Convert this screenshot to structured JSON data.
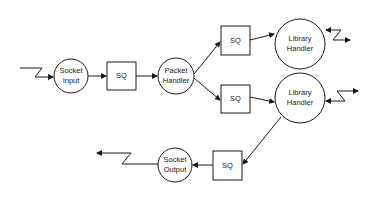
{
  "diagram": {
    "title": "",
    "stroke_color": "#1a1a1a",
    "background": "#ffffff",
    "nodes": [
      {
        "id": "socket-input",
        "shape": "circle",
        "label_line1": "Socket",
        "label_line2": "Input"
      },
      {
        "id": "sq-1",
        "shape": "square",
        "label": "SQ"
      },
      {
        "id": "packet-handler",
        "shape": "circle",
        "label_line1": "Packet",
        "label_line2": "Handler"
      },
      {
        "id": "sq-2",
        "shape": "square",
        "label": "SQ"
      },
      {
        "id": "sq-3",
        "shape": "square",
        "label": "SQ"
      },
      {
        "id": "library-handler-1",
        "shape": "circle",
        "label_line1": "Library",
        "label_line2": "Handler"
      },
      {
        "id": "library-handler-2",
        "shape": "circle",
        "label_line1": "Library",
        "label_line2": "Handler"
      },
      {
        "id": "sq-4",
        "shape": "square",
        "label": "SQ"
      },
      {
        "id": "socket-output",
        "shape": "circle",
        "label_line1": "Socket",
        "label_line2": "Output"
      }
    ],
    "edges": [
      {
        "from": "external-in",
        "to": "socket-input",
        "style": "lightning"
      },
      {
        "from": "socket-input",
        "to": "sq-1",
        "style": "arrow"
      },
      {
        "from": "sq-1",
        "to": "packet-handler",
        "style": "arrow"
      },
      {
        "from": "packet-handler",
        "to": "sq-2",
        "style": "arrow"
      },
      {
        "from": "packet-handler",
        "to": "sq-3",
        "style": "arrow"
      },
      {
        "from": "sq-2",
        "to": "library-handler-1",
        "style": "arrow"
      },
      {
        "from": "sq-3",
        "to": "library-handler-2",
        "style": "arrow"
      },
      {
        "from": "library-handler-1",
        "to": "external",
        "style": "lightning-bidirectional"
      },
      {
        "from": "library-handler-2",
        "to": "external",
        "style": "lightning-bidirectional"
      },
      {
        "from": "library-handler-2",
        "to": "sq-4",
        "style": "arrow"
      },
      {
        "from": "sq-4",
        "to": "socket-output",
        "style": "arrow"
      },
      {
        "from": "socket-output",
        "to": "external-out",
        "style": "lightning"
      }
    ]
  }
}
